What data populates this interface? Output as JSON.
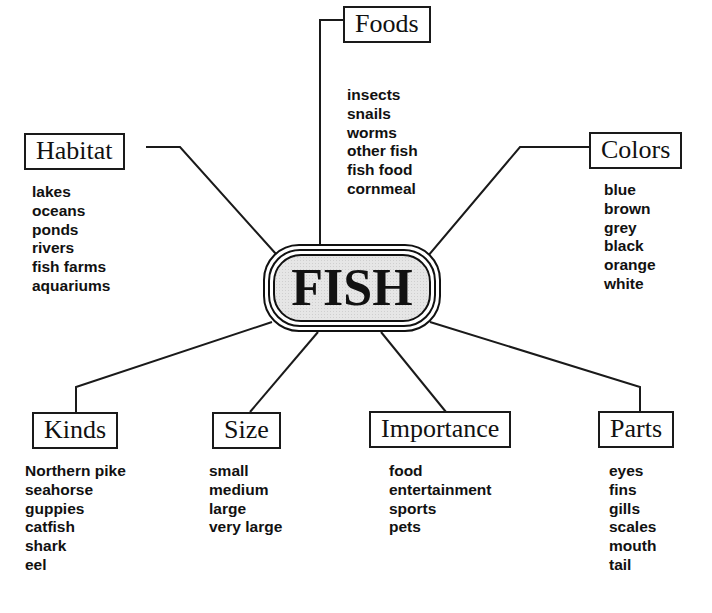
{
  "diagram": {
    "type": "concept-web",
    "center": {
      "label": "FISH"
    },
    "categories": [
      {
        "id": "habitat",
        "label": "Habitat",
        "items": [
          "lakes",
          "oceans",
          "ponds",
          "rivers",
          "fish farms",
          "aquariums"
        ]
      },
      {
        "id": "foods",
        "label": "Foods",
        "items": [
          "insects",
          "snails",
          "worms",
          "other fish",
          "fish food",
          "cornmeal"
        ]
      },
      {
        "id": "colors",
        "label": "Colors",
        "items": [
          "blue",
          "brown",
          "grey",
          "black",
          "orange",
          "white"
        ]
      },
      {
        "id": "kinds",
        "label": "Kinds",
        "items": [
          "Northern pike",
          "seahorse",
          "guppies",
          "catfish",
          "shark",
          "eel"
        ]
      },
      {
        "id": "size",
        "label": "Size",
        "items": [
          "small",
          "medium",
          "large",
          "very large"
        ]
      },
      {
        "id": "importance",
        "label": "Importance",
        "items": [
          "food",
          "entertainment",
          "sports",
          "pets"
        ]
      },
      {
        "id": "parts",
        "label": "Parts",
        "items": [
          "eyes",
          "fins",
          "gills",
          "scales",
          "mouth",
          "tail"
        ]
      }
    ]
  },
  "colors": {
    "line": "#1a1a1a",
    "text": "#111111",
    "center_fill": "#e6e6e6",
    "background": "#ffffff"
  }
}
